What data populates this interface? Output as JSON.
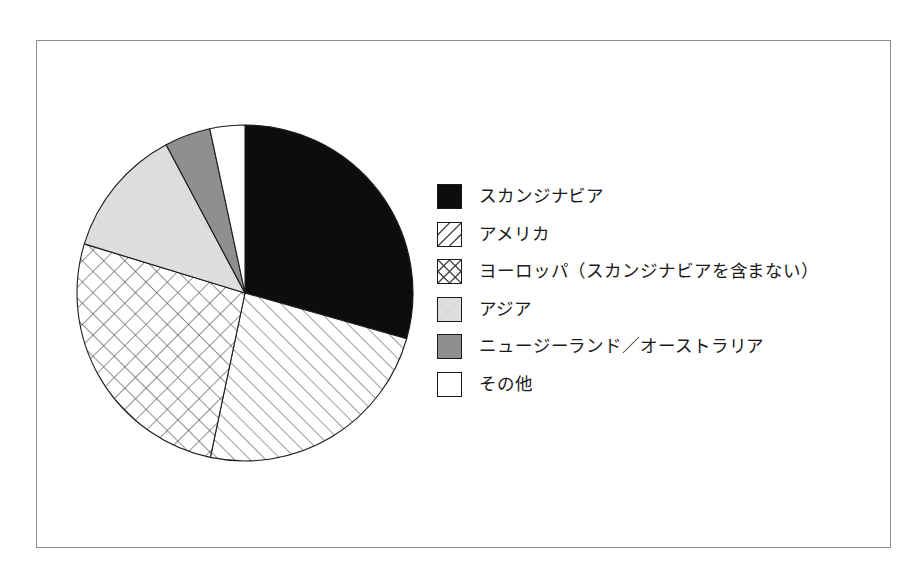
{
  "figure": {
    "frame_color": "#8d8d90",
    "background": "#ffffff"
  },
  "chart_data": {
    "type": "pie",
    "title": "",
    "subtitle": "",
    "xlabel": "",
    "ylabel": "",
    "legend_position": "right",
    "grid": false,
    "start_angle_deg": 0,
    "direction": "clockwise",
    "categories": [
      "スカンジナビア",
      "アメリカ",
      "ヨーロッパ（スカンジナビアを含まない）",
      "アジア",
      "ニュージーランド／オーストラリア",
      "その他"
    ],
    "values": [
      29.4,
      23.9,
      26.4,
      12.5,
      4.4,
      3.4
    ],
    "slices": [
      {
        "label": "スカンジナビア",
        "value": 29.4,
        "start_deg": 0,
        "end_deg": 105.8,
        "fill": "solid-black",
        "color": "#0d0d0d"
      },
      {
        "label": "アメリカ",
        "value": 23.9,
        "start_deg": 105.8,
        "end_deg": 191.9,
        "fill": "diagonal-hatch",
        "color": "#ffffff"
      },
      {
        "label": "ヨーロッパ（スカンジナビアを含まない）",
        "value": 26.4,
        "start_deg": 191.9,
        "end_deg": 287.0,
        "fill": "cross-hatch",
        "color": "#ffffff"
      },
      {
        "label": "アジア",
        "value": 12.5,
        "start_deg": 287.0,
        "end_deg": 332.0,
        "fill": "light-gray",
        "color": "#dcdcdc"
      },
      {
        "label": "ニュージーランド／オーストラリア",
        "value": 4.4,
        "start_deg": 332.0,
        "end_deg": 347.9,
        "fill": "medium-gray",
        "color": "#8f8f8f"
      },
      {
        "label": "その他",
        "value": 3.4,
        "start_deg": 347.9,
        "end_deg": 360.0,
        "fill": "white",
        "color": "#ffffff"
      }
    ]
  },
  "legend": {
    "items": [
      {
        "label": "スカンジナビア",
        "swatch": "solid-black-swatch"
      },
      {
        "label": "アメリカ",
        "swatch": "diagonal-hatch-swatch"
      },
      {
        "label": "ヨーロッパ（スカンジナビアを含まない）",
        "swatch": "cross-hatch-swatch"
      },
      {
        "label": "アジア",
        "swatch": "light-gray-swatch"
      },
      {
        "label": "ニュージーランド／オーストラリア",
        "swatch": "medium-gray-swatch"
      },
      {
        "label": "その他",
        "swatch": "white-swatch"
      }
    ]
  }
}
